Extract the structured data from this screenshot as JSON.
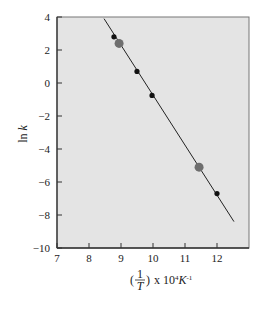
{
  "chart_data": {
    "type": "scatter",
    "title": "",
    "xlabel": "(1/T) x 10^4 K^-1",
    "xlabel_parts": {
      "open": "(",
      "num": "1",
      "den": "T",
      "close": ")",
      "suffix": "x 10",
      "exp": "4",
      "unit": "K",
      "unit_exp": "-1"
    },
    "ylabel": "ln k",
    "xlim": [
      7,
      13
    ],
    "ylim": [
      -10,
      4
    ],
    "xticks": [
      7,
      8,
      9,
      10,
      11,
      12
    ],
    "yticks": [
      4,
      2,
      0,
      -2,
      -4,
      -6,
      -8,
      -10
    ],
    "grid": false,
    "legend": null,
    "series": [
      {
        "name": "data points",
        "points": [
          {
            "x": 8.78,
            "y": 2.8,
            "style": "small-black"
          },
          {
            "x": 9.5,
            "y": 0.7,
            "style": "small-black"
          },
          {
            "x": 9.97,
            "y": -0.75,
            "style": "small-black"
          },
          {
            "x": 12.0,
            "y": -6.7,
            "style": "small-black"
          }
        ]
      },
      {
        "name": "highlighted points",
        "points": [
          {
            "x": 8.94,
            "y": 2.4,
            "style": "large-gray"
          },
          {
            "x": 11.44,
            "y": -5.1,
            "style": "large-gray"
          }
        ]
      },
      {
        "name": "linear fit",
        "type": "line",
        "points": [
          {
            "x": 8.47,
            "y": 3.9
          },
          {
            "x": 12.53,
            "y": -8.4
          }
        ]
      }
    ],
    "colors": {
      "plot_background": "#e4e4e4",
      "axis": "#333333",
      "small_point": "#111111",
      "large_point": "#6e6e6e",
      "line": "#222222"
    }
  }
}
